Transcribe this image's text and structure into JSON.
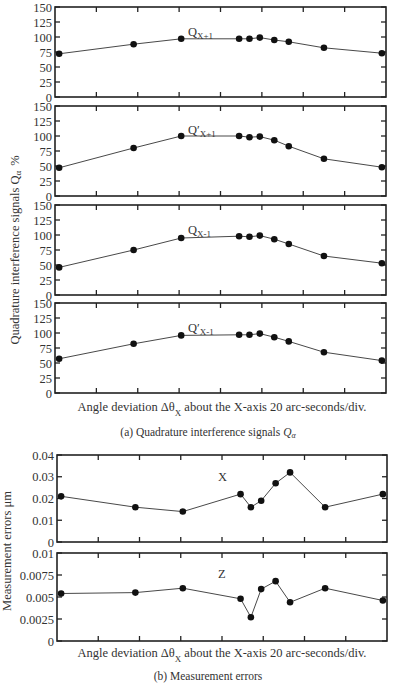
{
  "chart_data": [
    {
      "type": "line",
      "section": "a",
      "title": "Q_{X+1}",
      "label_main": "Q",
      "label_prime": "",
      "label_sub": "X+1",
      "xlabel": "Angle deviation Δθ_X about the X-axis 20 arc-seconds/div.",
      "ylabel": "Quadrature interference signals Q_α %",
      "ylim": [
        0,
        150
      ],
      "yticks": [
        0,
        25,
        50,
        75,
        100,
        125,
        150
      ],
      "ytick_labels": [
        "0",
        "25",
        "50",
        "75",
        "100",
        "125",
        "150"
      ],
      "x": [
        0.1,
        1.9,
        3.05,
        4.45,
        4.7,
        4.95,
        5.3,
        5.65,
        6.5,
        7.9
      ],
      "values": [
        72,
        88,
        97,
        97,
        97,
        99,
        95,
        92,
        82,
        73
      ],
      "grid": false
    },
    {
      "type": "line",
      "section": "a",
      "title": "Q'_{X+1}",
      "label_main": "Q",
      "label_prime": "′",
      "label_sub": "X+1",
      "ylim": [
        0,
        150
      ],
      "yticks": [
        0,
        25,
        50,
        75,
        100,
        125,
        150
      ],
      "ytick_labels": [
        "0",
        "25",
        "50",
        "75",
        "100",
        "125",
        "150"
      ],
      "x": [
        0.1,
        1.9,
        3.05,
        4.45,
        4.7,
        4.95,
        5.3,
        5.65,
        6.5,
        7.9
      ],
      "values": [
        47,
        80,
        100,
        100,
        98,
        99,
        93,
        83,
        62,
        48
      ],
      "grid": false
    },
    {
      "type": "line",
      "section": "a",
      "title": "Q_{X-1}",
      "label_main": "Q",
      "label_prime": "",
      "label_sub": "X-1",
      "ylim": [
        0,
        150
      ],
      "yticks": [
        0,
        25,
        50,
        75,
        100,
        125,
        150
      ],
      "ytick_labels": [
        "0",
        "25",
        "50",
        "75",
        "100",
        "125",
        "150"
      ],
      "x": [
        0.1,
        1.9,
        3.05,
        4.45,
        4.7,
        4.95,
        5.3,
        5.65,
        6.5,
        7.9
      ],
      "values": [
        46,
        75,
        95,
        98,
        97,
        99,
        93,
        85,
        65,
        53
      ],
      "grid": false
    },
    {
      "type": "line",
      "section": "a",
      "title": "Q'_{X-1}",
      "label_main": "Q",
      "label_prime": "′",
      "label_sub": "X-1",
      "ylim": [
        0,
        150
      ],
      "yticks": [
        0,
        25,
        50,
        75,
        100,
        125,
        150
      ],
      "ytick_labels": [
        "0",
        "25",
        "50",
        "75",
        "100",
        "125",
        "150"
      ],
      "x": [
        0.1,
        1.9,
        3.05,
        4.45,
        4.7,
        4.95,
        5.3,
        5.65,
        6.5,
        7.9
      ],
      "values": [
        57,
        82,
        96,
        97,
        97,
        99,
        93,
        86,
        68,
        54
      ],
      "grid": false
    },
    {
      "type": "line",
      "section": "b",
      "title": "X",
      "label_main": "X",
      "label_prime": "",
      "label_sub": "",
      "xlabel": "Angle deviation Δθ_X about the X-axis 20 arc-seconds/div.",
      "ylabel": "Measurement errors μm",
      "ylim": [
        0,
        0.04
      ],
      "yticks": [
        0,
        0.01,
        0.02,
        0.03,
        0.04
      ],
      "ytick_labels": [
        "0",
        "0.01",
        "0.02",
        "0.03",
        "0.04"
      ],
      "x": [
        0.1,
        1.9,
        3.05,
        4.45,
        4.7,
        4.95,
        5.3,
        5.65,
        6.5,
        7.9
      ],
      "values": [
        0.021,
        0.016,
        0.014,
        0.022,
        0.016,
        0.019,
        0.027,
        0.032,
        0.016,
        0.022
      ],
      "grid": false
    },
    {
      "type": "line",
      "section": "b",
      "title": "Z",
      "label_main": "Z",
      "label_prime": "",
      "label_sub": "",
      "ylim": [
        0,
        0.01
      ],
      "yticks": [
        0,
        0.0025,
        0.005,
        0.0075,
        0.01
      ],
      "ytick_labels": [
        "0",
        "0.0025",
        "0.005",
        "0.0075",
        "0.01"
      ],
      "x": [
        0.1,
        1.9,
        3.05,
        4.45,
        4.7,
        4.95,
        5.3,
        5.65,
        6.5,
        7.9
      ],
      "values": [
        0.0054,
        0.0055,
        0.006,
        0.0048,
        0.0027,
        0.0059,
        0.0068,
        0.0044,
        0.006,
        0.0046
      ],
      "grid": false
    }
  ],
  "figure": {
    "section_a": {
      "ylabel_main": "Quadrature interference signals Q",
      "ylabel_sub": "α",
      "ylabel_unit": "%",
      "xlabel_pre": "Angle deviation Δθ",
      "xlabel_sub": "X",
      "xlabel_post": "about the X-axis 20 arc-seconds/div.",
      "caption_pre": "(a) Quadrature interference signals ",
      "caption_sym": "Q",
      "caption_sub": "α"
    },
    "section_b": {
      "ylabel": "Measurement errors μm",
      "xlabel_pre": "Angle deviation Δθ",
      "xlabel_sub": "X",
      "xlabel_post": "about the X-axis 20 arc-seconds/div.",
      "caption": "(b) Measurement errors"
    }
  }
}
